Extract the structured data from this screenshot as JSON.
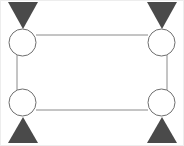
{
  "figure": {
    "type": "diagram",
    "width": 184,
    "height": 146,
    "background_color": "#ffffff"
  },
  "style": {
    "node_fill": "#ffffff",
    "node_stroke": "#6e6e6e",
    "node_stroke_width": 1,
    "edge_stroke": "#8a8a8a",
    "edge_stroke_width": 1,
    "triangle_fill": "#4a4a4a",
    "frame_stroke": "#ededed"
  },
  "nodes": [
    {
      "id": "node-top-left",
      "label": "",
      "cx": 22.5,
      "cy": 42.5,
      "r": 13.5
    },
    {
      "id": "node-top-right",
      "label": "",
      "cx": 161.5,
      "cy": 42.5,
      "r": 13.5
    },
    {
      "id": "node-bottom-left",
      "label": "",
      "cx": 22.5,
      "cy": 102.5,
      "r": 13.5
    },
    {
      "id": "node-bottom-right",
      "label": "",
      "cx": 161.5,
      "cy": 102.5,
      "r": 13.5
    }
  ],
  "edges": [
    {
      "id": "edge-top",
      "label": "",
      "x1": 36,
      "y1": 35,
      "x2": 148,
      "y2": 35
    },
    {
      "id": "edge-bottom",
      "label": "",
      "x1": 36,
      "y1": 110,
      "x2": 148,
      "y2": 110
    },
    {
      "id": "edge-left",
      "label": "",
      "x1": 17,
      "y1": 55,
      "x2": 17,
      "y2": 90
    },
    {
      "id": "edge-right",
      "label": "",
      "x1": 167,
      "y1": 55,
      "x2": 167,
      "y2": 90
    }
  ],
  "supports": [
    {
      "id": "support-top-left",
      "label": "",
      "direction": "down",
      "points": "8,2 38,2 23,29"
    },
    {
      "id": "support-top-right",
      "label": "",
      "direction": "down",
      "points": "147,2 177,2 162,29"
    },
    {
      "id": "support-bottom-left",
      "label": "",
      "direction": "up",
      "points": "23,117 38,143 8,143"
    },
    {
      "id": "support-bottom-right",
      "label": "",
      "direction": "up",
      "points": "162,117 177,143 147,143"
    }
  ],
  "frame": {
    "x": 0.5,
    "y": 0.5,
    "width": 183,
    "height": 145
  }
}
